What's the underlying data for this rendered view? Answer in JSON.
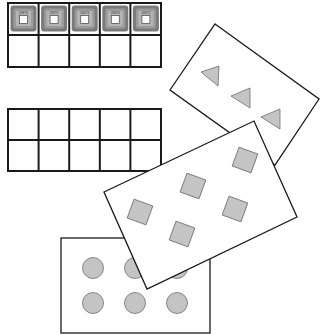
{
  "scene": {
    "description": "Ten-frame worksheet with unit tiles and picture cards",
    "colors": {
      "line": "#1a1a1a",
      "shape_fill": "#c4c4c4",
      "shape_stroke": "#6e6e6e",
      "tile_outer": "#7a7a7a",
      "tile_mid": "#9b9b9b",
      "tile_inner": "#b5b5b5",
      "background": "#ffffff"
    }
  },
  "ten_frames": [
    {
      "name": "filled-ten-frame",
      "x": 8,
      "y": 3,
      "width": 153,
      "height": 64,
      "rows": 2,
      "cols": 5,
      "filled_cells": 5,
      "tile_label": "UNITS"
    },
    {
      "name": "empty-ten-frame",
      "x": 8,
      "y": 109,
      "width": 153,
      "height": 62,
      "rows": 2,
      "cols": 5,
      "filled_cells": 0
    }
  ],
  "cards": [
    {
      "name": "triangle-card",
      "shape": "triangle",
      "count": 3,
      "corners": [
        [
          215,
          24
        ],
        [
          319,
          99
        ],
        [
          275,
          165
        ],
        [
          170,
          90
        ]
      ]
    },
    {
      "name": "square-card",
      "shape": "square",
      "count": 6,
      "corners": [
        [
          104,
          192
        ],
        [
          254,
          121
        ],
        [
          297,
          217
        ],
        [
          147,
          289
        ]
      ]
    },
    {
      "name": "circle-card",
      "shape": "circle",
      "count": 6,
      "x": 61,
      "y": 238,
      "width": 149,
      "height": 95
    }
  ]
}
